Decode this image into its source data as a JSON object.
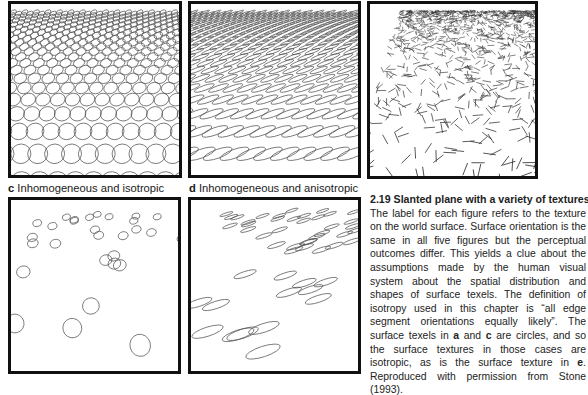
{
  "figure": {
    "number": "2.19",
    "title": "Slanted plane with a variety of textures",
    "panels": [
      {
        "id": "a",
        "letter": "",
        "label": "",
        "texture": "circles",
        "distribution": "homogeneous"
      },
      {
        "id": "b",
        "letter": "",
        "label": "",
        "texture": "ellipses",
        "distribution": "homogeneous"
      },
      {
        "id": "e",
        "letter": "",
        "label": "",
        "texture": "line-segments",
        "distribution": "random"
      },
      {
        "id": "c",
        "letter": "c",
        "label": "Inhomogeneous and isotropic",
        "texture": "circles",
        "distribution": "random"
      },
      {
        "id": "d",
        "letter": "d",
        "label": "Inhomogeneous and anisotropic",
        "texture": "ellipses",
        "distribution": "random"
      }
    ],
    "caption": {
      "p1": "The label for each figure refers to the texture on the world surface. Surface orientation is the same in all five figures but the perceptual outcomes differ. This yields a clue about the assumptions made by the human visual system about the spatial distribution and shapes of surface texels. The definition of isotropy used in this chapter is “all edge segment orientations equally likely”. The surface texels in ",
      "a": "a",
      "and": " and ",
      "c": "c",
      "p2": " are circles, and so the surface textures in those cases are isotropic, as is the surface texture in ",
      "e": "e",
      "p3": ". Reproduced with permission from Stone (1993)."
    }
  },
  "colors": {
    "border": "#111111",
    "stroke": "#555555",
    "text": "#222222"
  }
}
